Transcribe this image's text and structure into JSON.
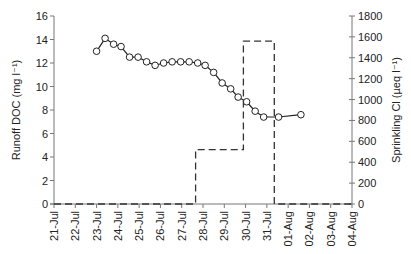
{
  "chart_data": {
    "type": "line",
    "title": "",
    "xlabel": "",
    "ylabel": "Runoff DOC (mg l⁻¹)",
    "y2label": "Sprinkling Cl (µeq l⁻¹)",
    "x_ticks": [
      "21-Jul",
      "22-Jul",
      "23-Jul",
      "24-Jul",
      "25-Jul",
      "26-Jul",
      "27-Jul",
      "28-Jul",
      "29-Jul",
      "30-Jul",
      "31-Jul",
      "01-Aug",
      "02-Aug",
      "03-Aug",
      "04-Aug"
    ],
    "xlim_days": [
      0,
      14
    ],
    "ylim": [
      0,
      16
    ],
    "y_ticks": [
      0,
      2,
      4,
      6,
      8,
      10,
      12,
      14,
      16
    ],
    "y2lim": [
      0,
      1800
    ],
    "y2_ticks": [
      0,
      200,
      400,
      600,
      800,
      1000,
      1200,
      1400,
      1600,
      1800
    ],
    "grid": false,
    "legend": "none",
    "series": [
      {
        "name": "Runoff DOC",
        "axis": "left",
        "style": "line-with-open-circles",
        "x_days": [
          2.0,
          2.4,
          2.8,
          3.15,
          3.55,
          3.95,
          4.35,
          4.75,
          5.15,
          5.55,
          5.95,
          6.35,
          6.75,
          7.1,
          7.5,
          7.9,
          8.3,
          8.65,
          9.05,
          9.45,
          9.85,
          10.55,
          11.6
        ],
        "values": [
          13.0,
          14.1,
          13.6,
          13.4,
          12.5,
          12.5,
          12.1,
          11.8,
          12.0,
          12.1,
          12.1,
          12.1,
          12.0,
          11.8,
          11.2,
          10.3,
          9.8,
          9.1,
          8.7,
          7.9,
          7.4,
          7.4,
          7.6
        ]
      },
      {
        "name": "Sprinkling Cl",
        "axis": "right",
        "style": "dashed-step",
        "x_days": [
          0,
          6.65,
          6.65,
          8.9,
          8.9,
          10.35,
          10.35,
          14
        ],
        "values": [
          0,
          0,
          520,
          520,
          1560,
          1560,
          0,
          0
        ]
      }
    ]
  }
}
